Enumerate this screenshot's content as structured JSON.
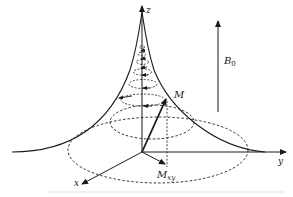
{
  "diagram": {
    "labels": {
      "z_axis": "z",
      "y_axis": "y",
      "x_axis": "x",
      "magnetization": "M",
      "transverse_main": "M",
      "transverse_sub": "xy",
      "field_main": "B",
      "field_sub": "0"
    },
    "colors": {
      "stroke": "#1a1a1a",
      "background": "#ffffff"
    }
  }
}
